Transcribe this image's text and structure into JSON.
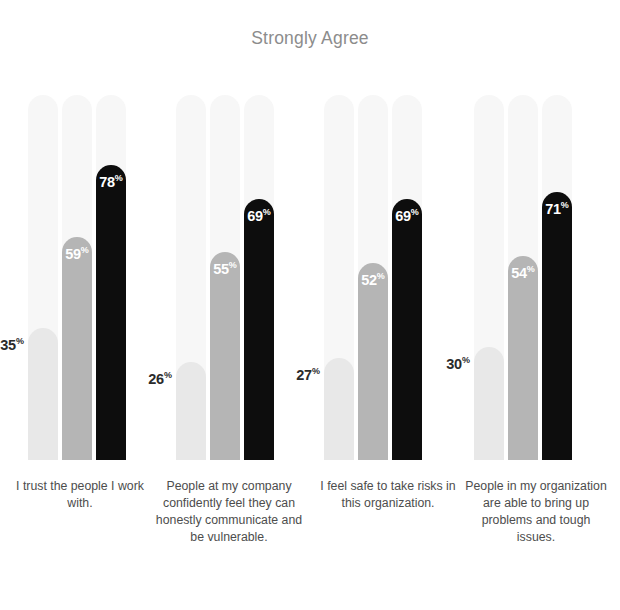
{
  "chart": {
    "title": "Strongly Agree"
  },
  "chart_data": {
    "type": "bar",
    "title": "Strongly Agree",
    "xlabel": "",
    "ylabel": "",
    "ylim": [
      0,
      100
    ],
    "grid": false,
    "legend": "none",
    "value_suffix": "%",
    "categories": [
      "I trust the people I work with.",
      "People at my company confidently feel they can honestly communicate and be vulnerable.",
      "I feel safe to take risks in this organization.",
      "People in my organization are able to bring up problems and tough issues."
    ],
    "series": [
      {
        "name": "series-1",
        "color": "#e8e8e8",
        "values": [
          35,
          26,
          27,
          30
        ]
      },
      {
        "name": "series-2",
        "color": "#b5b5b5",
        "values": [
          59,
          55,
          52,
          54
        ]
      },
      {
        "name": "series-3",
        "color": "#0d0d0d",
        "values": [
          78,
          69,
          69,
          71
        ]
      }
    ],
    "track_color": "#f7f7f7",
    "groups": [
      {
        "label": "I trust the people I work with.",
        "bars": [
          {
            "value": 35,
            "display": "35",
            "suffix": "%",
            "color": "#e8e8e8",
            "label_position": "outside"
          },
          {
            "value": 59,
            "display": "59",
            "suffix": "%",
            "color": "#b5b5b5",
            "label_position": "inside"
          },
          {
            "value": 78,
            "display": "78",
            "suffix": "%",
            "color": "#0d0d0d",
            "label_position": "inside"
          }
        ]
      },
      {
        "label": "People at my company confidently feel they can honestly communicate and be vulnerable.",
        "bars": [
          {
            "value": 26,
            "display": "26",
            "suffix": "%",
            "color": "#e8e8e8",
            "label_position": "outside"
          },
          {
            "value": 55,
            "display": "55",
            "suffix": "%",
            "color": "#b5b5b5",
            "label_position": "inside"
          },
          {
            "value": 69,
            "display": "69",
            "suffix": "%",
            "color": "#0d0d0d",
            "label_position": "inside"
          }
        ]
      },
      {
        "label": "I feel safe to take risks in this organization.",
        "bars": [
          {
            "value": 27,
            "display": "27",
            "suffix": "%",
            "color": "#e8e8e8",
            "label_position": "outside"
          },
          {
            "value": 52,
            "display": "52",
            "suffix": "%",
            "color": "#b5b5b5",
            "label_position": "inside"
          },
          {
            "value": 69,
            "display": "69",
            "suffix": "%",
            "color": "#0d0d0d",
            "label_position": "inside"
          }
        ]
      },
      {
        "label": "People in my organization are able to bring up problems and tough issues.",
        "bars": [
          {
            "value": 30,
            "display": "30",
            "suffix": "%",
            "color": "#e8e8e8",
            "label_position": "outside"
          },
          {
            "value": 54,
            "display": "54",
            "suffix": "%",
            "color": "#b5b5b5",
            "label_position": "inside"
          },
          {
            "value": 71,
            "display": "71",
            "suffix": "%",
            "color": "#0d0d0d",
            "label_position": "inside"
          }
        ]
      }
    ]
  },
  "layout": {
    "group_left": [
      28,
      176,
      324,
      474
    ],
    "bar_pitch": 34,
    "label_boxes": [
      {
        "left": 10,
        "width": 140
      },
      {
        "left": 150,
        "width": 158
      },
      {
        "left": 312,
        "width": 152
      },
      {
        "left": 462,
        "width": 148
      }
    ]
  }
}
